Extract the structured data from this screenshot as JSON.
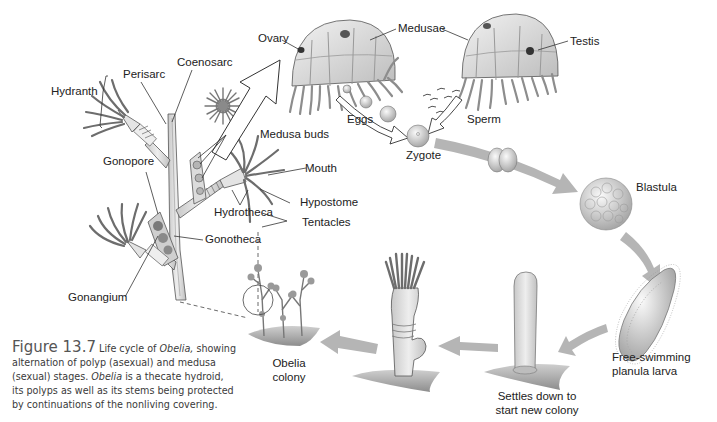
{
  "figure": {
    "number_label": "Figure 13.7",
    "caption_parts": [
      {
        "text": "Life cycle of ",
        "italic": false
      },
      {
        "text": "Obelia,",
        "italic": true
      },
      {
        "text": " showing alternation of polyp (asexual) and medusa (sexual) stages. ",
        "italic": false
      },
      {
        "text": "Obelia",
        "italic": true
      },
      {
        "text": " is a thecate hydroid, its polyps as well as its stems being protected by continuations of the nonliving covering.",
        "italic": false
      }
    ]
  },
  "labels": {
    "hydranth": "Hydranth",
    "perisarc": "Perisarc",
    "coenosarc": "Coenosarc",
    "gonopore": "Gonopore",
    "medusa_buds": "Medusa buds",
    "mouth": "Mouth",
    "hypostome": "Hypostome",
    "hydrotheca": "Hydrotheca",
    "tentacles": "Tentacles",
    "gonotheca": "Gonotheca",
    "gonangium": "Gonangium",
    "ovary": "Ovary",
    "medusae": "Medusae",
    "testis": "Testis",
    "eggs": "Eggs",
    "sperm": "Sperm",
    "zygote": "Zygote",
    "blastula": "Blastula",
    "planula_line1": "Free-swimming",
    "planula_line2": "planula larva",
    "settles_line1": "Settles down to",
    "settles_line2": "start new colony",
    "colony_line1": "Obelia",
    "colony_line2": "colony"
  },
  "colors": {
    "line": "#333333",
    "arrow_fill": "#b5b5b5",
    "tissue": "#d9d9d9",
    "dark_tissue": "#6e6e6e",
    "text": "#222222"
  },
  "stages": [
    "Polyp colony",
    "Medusa buds",
    "Medusae",
    "Eggs and sperm",
    "Zygote",
    "Cleavage",
    "Blastula",
    "Free-swimming planula larva",
    "Settles down to start new colony",
    "Young polyp",
    "Obelia colony"
  ]
}
